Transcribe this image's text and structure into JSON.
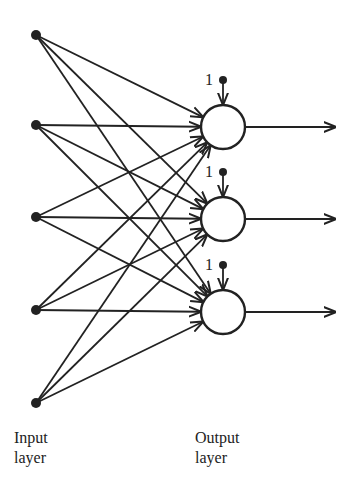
{
  "diagram": {
    "type": "single-layer neural network",
    "input_nodes": [
      {
        "x": 36,
        "y": 35
      },
      {
        "x": 36,
        "y": 125
      },
      {
        "x": 36,
        "y": 217
      },
      {
        "x": 36,
        "y": 310
      },
      {
        "x": 36,
        "y": 403
      }
    ],
    "output_nodes": [
      {
        "x": 223,
        "y": 127,
        "r": 22
      },
      {
        "x": 223,
        "y": 219,
        "r": 22
      },
      {
        "x": 223,
        "y": 312,
        "r": 22
      }
    ],
    "bias_label": "1",
    "colors": {
      "ink": "#222222",
      "background": "#ffffff"
    }
  },
  "labels": {
    "input": {
      "line1": "Input",
      "line2": "layer"
    },
    "output": {
      "line1": "Output",
      "line2": "layer"
    },
    "bias": [
      "1",
      "1",
      "1"
    ]
  }
}
